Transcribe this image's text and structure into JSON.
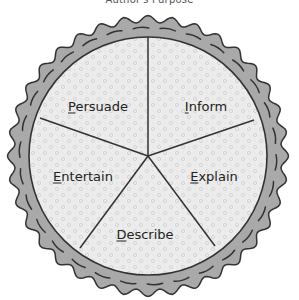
{
  "title": "Author's Purpose",
  "diagram": {
    "type": "pie-diagram",
    "center": [
      148,
      156
    ],
    "inner_radius": 119,
    "crust_color": "#a9a9a9",
    "fill_color": "#ececec",
    "line_color": "#333333",
    "slices": [
      {
        "label": "Inform",
        "first": "I",
        "rest": "nform",
        "pos": [
          206,
          106
        ]
      },
      {
        "label": "Explain",
        "first": "E",
        "rest": "xplain",
        "pos": [
          214,
          176
        ]
      },
      {
        "label": "Describe",
        "first": "D",
        "rest": "escribe",
        "pos": [
          145,
          234
        ]
      },
      {
        "label": "Entertain",
        "first": "E",
        "rest": "ntertain",
        "pos": [
          83,
          176
        ]
      },
      {
        "label": "Persuade",
        "first": "P",
        "rest": "ersuade",
        "pos": [
          98,
          106
        ]
      }
    ]
  }
}
